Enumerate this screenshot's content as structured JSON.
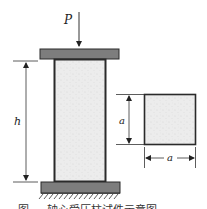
{
  "figure": {
    "type": "axial-compression-column-specimen",
    "load_label": "P",
    "height_label": "h",
    "section_height_label": "a",
    "section_width_label": "a",
    "caption": "图 … 轴心受压柱试件示意图",
    "colors": {
      "plate_fill": "#7d7d7d",
      "outline": "#2a2a2a",
      "specimen_fill": "#ebebeb",
      "dimension_line": "#333333"
    }
  }
}
